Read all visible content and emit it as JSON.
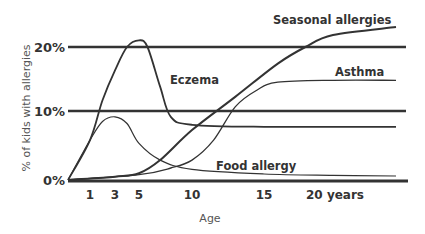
{
  "chart_data": {
    "type": "line",
    "title": "",
    "xlabel": "Age",
    "ylabel": "% of kids with allergies",
    "x_ticks": [
      {
        "value": 1,
        "label": "1"
      },
      {
        "value": 3,
        "label": "3"
      },
      {
        "value": 5,
        "label": "5"
      },
      {
        "value": 10,
        "label": "10"
      },
      {
        "value": 15,
        "label": "15"
      },
      {
        "value": 20,
        "label": "20 years"
      }
    ],
    "y_ticks": [
      {
        "value": 0,
        "label": "0%"
      },
      {
        "value": 10,
        "label": "10%"
      },
      {
        "value": 20,
        "label": "20%"
      }
    ],
    "xlim": [
      0,
      24
    ],
    "ylim": [
      0,
      23
    ],
    "grid": "horizontal lines at 0%, 10%, 20%",
    "legend": "inline labels",
    "series": [
      {
        "name": "Eczema",
        "points": [
          [
            0,
            0
          ],
          [
            1,
            6
          ],
          [
            2,
            12
          ],
          [
            3,
            16.5
          ],
          [
            4,
            20
          ],
          [
            5,
            21
          ],
          [
            5.8,
            20
          ],
          [
            7,
            14
          ],
          [
            8,
            9.5
          ],
          [
            10,
            8.3
          ],
          [
            15,
            8
          ],
          [
            24,
            8
          ]
        ]
      },
      {
        "name": "Food allergy",
        "points": [
          [
            0,
            0
          ],
          [
            1,
            6
          ],
          [
            2,
            8.8
          ],
          [
            3,
            9.5
          ],
          [
            4,
            8.5
          ],
          [
            5,
            5.5
          ],
          [
            7,
            3
          ],
          [
            10,
            1.6
          ],
          [
            15,
            0.9
          ],
          [
            20,
            0.7
          ],
          [
            24,
            0.6
          ]
        ]
      },
      {
        "name": "Seasonal allergies",
        "points": [
          [
            0,
            0
          ],
          [
            3,
            0.5
          ],
          [
            5,
            1
          ],
          [
            7,
            3
          ],
          [
            10,
            7.5
          ],
          [
            13,
            12.5
          ],
          [
            16,
            17.5
          ],
          [
            18,
            20
          ],
          [
            20,
            21.8
          ],
          [
            24,
            23
          ]
        ]
      },
      {
        "name": "Asthma",
        "points": [
          [
            0,
            0
          ],
          [
            5,
            0.8
          ],
          [
            8,
            1.8
          ],
          [
            10,
            3
          ],
          [
            11.5,
            6
          ],
          [
            13,
            11
          ],
          [
            14.5,
            13.5
          ],
          [
            16,
            14.7
          ],
          [
            20,
            15
          ],
          [
            24,
            15
          ]
        ]
      }
    ]
  },
  "labels": {
    "eczema": "Eczema",
    "food_allergy": "Food allergy",
    "seasonal": "Seasonal allergies",
    "asthma": "Asthma",
    "x_axis_title": "Age",
    "y_axis_title": "% of kids with allergies",
    "y0": "0%",
    "y10": "10%",
    "y20": "20%",
    "x1": "1",
    "x3": "3",
    "x5": "5",
    "x10": "10",
    "x15": "15",
    "x20": "20 years"
  },
  "colors": {
    "line": "#333333",
    "text": "#333333",
    "axis_title": "#555555"
  }
}
